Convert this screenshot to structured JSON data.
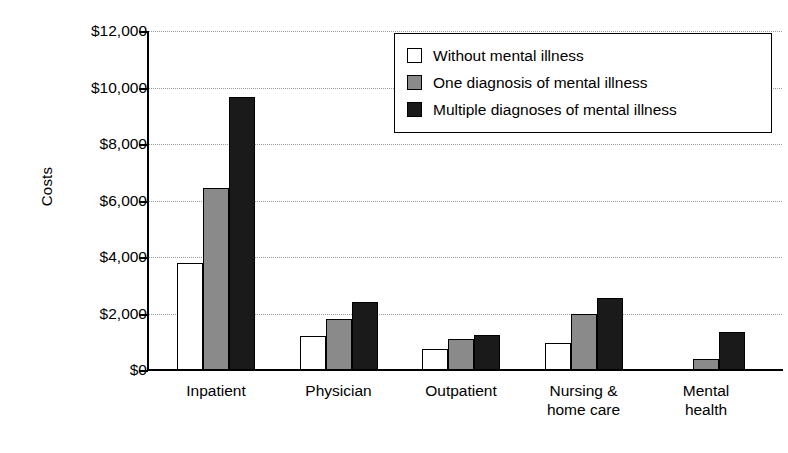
{
  "chart_data": {
    "type": "bar",
    "title": "",
    "xlabel": "",
    "ylabel": "Costs",
    "ylim": [
      0,
      12000
    ],
    "ytick_values": [
      12000,
      10000,
      8000,
      6000,
      4000,
      2000,
      0
    ],
    "ytick_labels": [
      "$12,000",
      "$10,000",
      "$8,000",
      "$6,000",
      "$4,000",
      "$2,000",
      "$0"
    ],
    "grid": true,
    "legend_position": "top-right",
    "categories": [
      "Inpatient",
      "Physician",
      "Outpatient",
      "Nursing &\nhome care",
      "Mental\nhealth"
    ],
    "series": [
      {
        "name": "Without mental illness",
        "color": "#ffffff",
        "values": [
          3800,
          1200,
          750,
          950,
          0
        ]
      },
      {
        "name": "One diagnosis of mental illness",
        "color": "#8a8a8a",
        "values": [
          6450,
          1800,
          1100,
          2000,
          400
        ]
      },
      {
        "name": "Multiple diagnoses of mental illness",
        "color": "#1a1a1a",
        "values": [
          9650,
          2400,
          1250,
          2550,
          1350
        ]
      }
    ]
  },
  "legend": {
    "items": [
      {
        "label": "Without mental illness",
        "swatch": "white-square-icon"
      },
      {
        "label": "One diagnosis of mental illness",
        "swatch": "gray-square-icon"
      },
      {
        "label": "Multiple diagnoses of mental illness",
        "swatch": "black-square-icon"
      }
    ]
  }
}
